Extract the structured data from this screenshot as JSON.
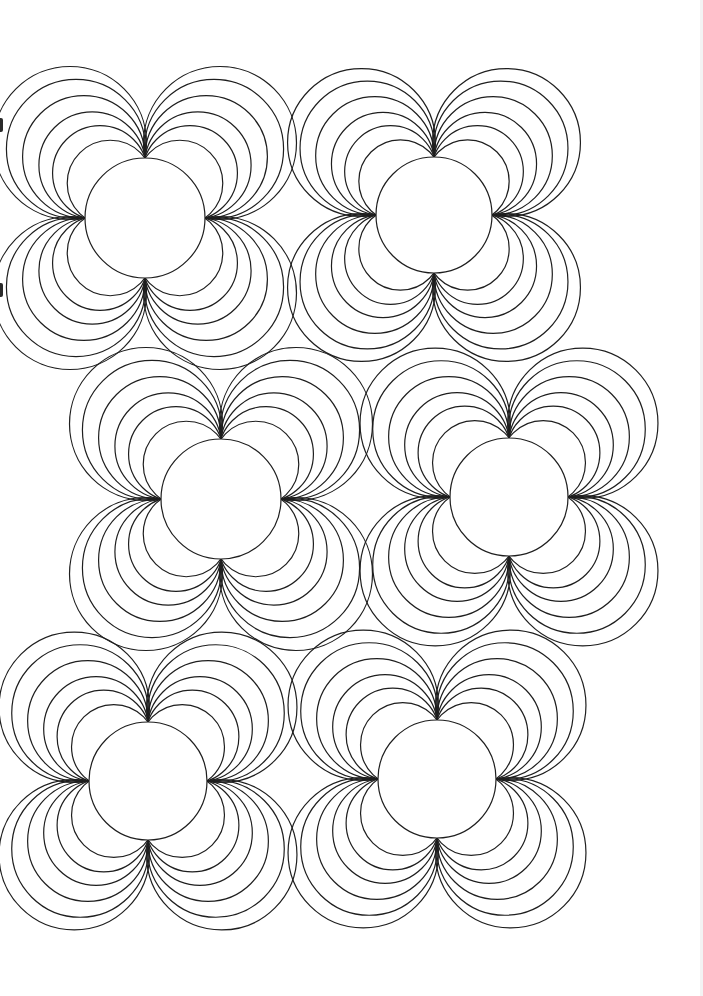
{
  "page": {
    "background": "#ffffff",
    "stroke_color": "#1e1e1e",
    "stroke_width": 1.2,
    "width": 703,
    "height": 996
  },
  "pattern": {
    "type": "coloring-page-circle-flower-motifs",
    "lobe_offsets_relative_to_radius": [
      0.58,
      0.75,
      0.88,
      1.02,
      1.15,
      1.25
    ],
    "motifs": [
      {
        "id": "motif-1",
        "cx": 145,
        "cy": 218,
        "r": 60
      },
      {
        "id": "motif-2",
        "cx": 434,
        "cy": 215,
        "r": 58
      },
      {
        "id": "motif-3",
        "cx": 221,
        "cy": 499,
        "r": 60
      },
      {
        "id": "motif-4",
        "cx": 509,
        "cy": 497,
        "r": 59
      },
      {
        "id": "motif-5",
        "cx": 148,
        "cy": 781,
        "r": 59
      },
      {
        "id": "motif-6",
        "cx": 437,
        "cy": 779,
        "r": 59
      }
    ]
  },
  "artifacts": {
    "left_edge_marks_y": [
      118,
      283
    ],
    "right_edge_strip_color": "#f3f3f3"
  }
}
